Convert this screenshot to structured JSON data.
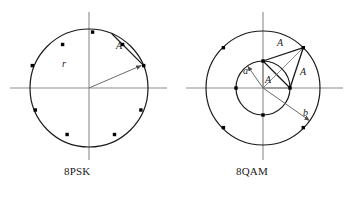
{
  "figure": {
    "title_psk": "8PSK",
    "title_qam": "8QAM",
    "colors": {
      "axis": "#8c8c8c",
      "circle": "#1a1a1a",
      "point": "#000000",
      "vector": "#6b6b6b",
      "chord": "#1a1a1a",
      "text": "#1a1a1a",
      "background": "#ffffff"
    }
  },
  "psk": {
    "label": "8PSK",
    "center": {
      "x": 89,
      "y": 88
    },
    "radius": 59,
    "num_points": 8,
    "point_angles_deg": [
      22.5,
      67.5,
      112.5,
      157.5,
      202.5,
      247.5,
      292.5,
      337.5
    ],
    "annotations": {
      "radius_label": "r",
      "radius_label_pos": {
        "x": 62,
        "y": 67
      },
      "radius_vector_angle_deg": 22.5,
      "chord_label": "A",
      "chord_label_pos": {
        "x": 116,
        "y": 48
      },
      "chord_between_angles_deg": [
        22.5,
        67.5
      ]
    },
    "axes": {
      "x_from": {
        "x": 10,
        "y": 88
      },
      "x_to": {
        "x": 167,
        "y": 88
      },
      "y_from": {
        "x": 89,
        "y": 12
      },
      "y_to": {
        "x": 89,
        "y": 160
      }
    }
  },
  "qam": {
    "label": "8QAM",
    "center": {
      "x": 263,
      "y": 88
    },
    "outer_radius": 57,
    "inner_radius": 27,
    "outer_point_angles_deg": [
      45,
      135,
      225,
      315
    ],
    "inner_point_angles_deg": [
      0,
      90,
      180,
      270
    ],
    "annotations": {
      "inner_radius_label": "a",
      "inner_radius_label_pos": {
        "x": 243,
        "y": 70
      },
      "inner_vector_angle_deg": 125,
      "outer_radius_label": "b",
      "outer_radius_label_pos": {
        "x": 305,
        "y": 113
      },
      "outer_vector_angle_deg": -35,
      "side_labels": [
        "A",
        "A",
        "A"
      ],
      "side_label_positions": [
        {
          "x": 280,
          "y": 44
        },
        {
          "x": 303,
          "y": 74
        },
        {
          "x": 268,
          "y": 80
        }
      ],
      "triangle_vertices_deg": [
        {
          "circle": "inner",
          "angle": 90
        },
        {
          "circle": "outer",
          "angle": 45
        },
        {
          "circle": "inner",
          "angle": 0
        }
      ]
    },
    "axes": {
      "x_from": {
        "x": 186,
        "y": 88
      },
      "x_to": {
        "x": 343,
        "y": 88
      },
      "y_from": {
        "x": 263,
        "y": 12
      },
      "y_to": {
        "x": 263,
        "y": 160
      }
    }
  }
}
